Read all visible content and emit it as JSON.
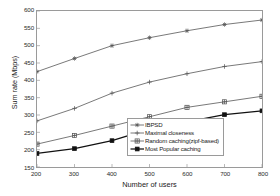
{
  "chart_data": {
    "type": "line",
    "title": "",
    "xlabel": "Number of users",
    "ylabel": "Sum rate (Mbps)",
    "x": [
      200,
      300,
      400,
      500,
      600,
      700,
      800
    ],
    "xlim": [
      200,
      800
    ],
    "ylim": [
      150,
      600
    ],
    "xticks": [
      "200",
      "300",
      "400",
      "500",
      "600",
      "700",
      "800"
    ],
    "yticks": [
      "150",
      "200",
      "250",
      "300",
      "350",
      "400",
      "450",
      "500",
      "550",
      "600"
    ],
    "grid": false,
    "legend_position": "lower right",
    "series": [
      {
        "name": "IBPSD",
        "marker": "star",
        "color": "#555555",
        "values": [
          425,
          463,
          500,
          523,
          543,
          561,
          574
        ]
      },
      {
        "name": "Maximal closeness",
        "marker": "plus",
        "color": "#555555",
        "values": [
          283,
          319,
          363,
          395,
          419,
          440,
          454
        ]
      },
      {
        "name": "Random caching(zipf-based)",
        "marker": "plus-box",
        "color": "#555555",
        "values": [
          216,
          241,
          268,
          295,
          322,
          338,
          354
        ]
      },
      {
        "name": "Most Popular caching",
        "marker": "filled-square",
        "color": "#111111",
        "values": [
          189,
          203,
          226,
          259,
          280,
          301,
          312
        ]
      }
    ]
  }
}
